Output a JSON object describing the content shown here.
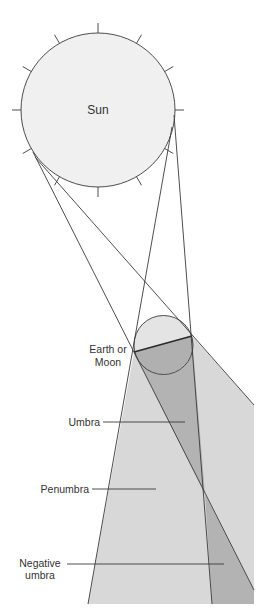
{
  "diagram": {
    "sun": {
      "label": "Sun"
    },
    "body": {
      "label_line1": "Earth or",
      "label_line2": "Moon"
    },
    "labels": {
      "umbra": "Umbra",
      "penumbra": "Penumbra",
      "negative_umbra_line1": "Negative",
      "negative_umbra_line2": "umbra"
    },
    "colors": {
      "sun_fill": "#f0f0f0",
      "penumbra_fill": "#d8d8d8",
      "umbra_fill": "#b3b3b3",
      "body_lit_fill": "#e4e4e4",
      "body_dark_fill": "#b0b0b0",
      "line": "#3a3a3a"
    }
  }
}
